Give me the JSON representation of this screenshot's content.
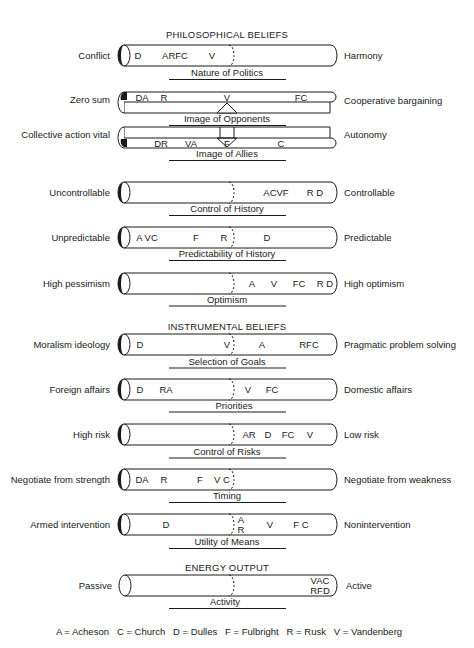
{
  "sections": {
    "philosophical": "PHILOSOPHICAL BELIEFS",
    "instrumental": "INSTRUMENTAL BELIEFS",
    "energy": "ENERGY OUTPUT"
  },
  "scales": [
    {
      "title": "Nature of Politics",
      "left": "Conflict",
      "right": "Harmony",
      "markers": [
        {
          "text": "D",
          "x": 138
        },
        {
          "text": "ARFC",
          "x": 175
        },
        {
          "text": "V",
          "x": 212
        }
      ]
    },
    {
      "title": "Image of Opponents",
      "left": "Zero sum",
      "right": "Cooperative bargaining",
      "markers": [
        {
          "text": "DA",
          "x": 142
        },
        {
          "text": "R",
          "x": 164
        },
        {
          "text": "V",
          "x": 227
        },
        {
          "text": "FC",
          "x": 301
        }
      ]
    },
    {
      "title": "Image of Allies",
      "left": "Collective action vital",
      "right": "Autonomy",
      "markers": [
        {
          "text": "DR",
          "x": 161
        },
        {
          "text": "VA",
          "x": 191
        },
        {
          "text": "F",
          "x": 227
        },
        {
          "text": "C",
          "x": 281
        }
      ]
    },
    {
      "title": "Control of History",
      "left": "Uncontrollable",
      "right": "Controllable",
      "markers": [
        {
          "text": "ACVF",
          "x": 276
        },
        {
          "text": "R D",
          "x": 315
        }
      ]
    },
    {
      "title": "Predictability of History",
      "left": "Unpredictable",
      "right": "Predictable",
      "markers": [
        {
          "text": "A VC",
          "x": 147
        },
        {
          "text": "F",
          "x": 196
        },
        {
          "text": "R",
          "x": 224
        },
        {
          "text": "D",
          "x": 267
        }
      ]
    },
    {
      "title": "Optimism",
      "left": "High pessimism",
      "right": "High optimism",
      "markers": [
        {
          "text": "A",
          "x": 252
        },
        {
          "text": "V",
          "x": 274
        },
        {
          "text": "FC",
          "x": 299
        },
        {
          "text": "R D",
          "x": 325
        }
      ]
    },
    {
      "title": "Selection of Goals",
      "left": "Moralism ideology",
      "right": "Pragmatic problem solving",
      "markers": [
        {
          "text": "D",
          "x": 140
        },
        {
          "text": "V",
          "x": 227
        },
        {
          "text": "A",
          "x": 262
        },
        {
          "text": "RFC",
          "x": 309
        }
      ]
    },
    {
      "title": "Priorities",
      "left": "Foreign affairs",
      "right": "Domestic affairs",
      "markers": [
        {
          "text": "D",
          "x": 140
        },
        {
          "text": "RA",
          "x": 166
        },
        {
          "text": "V",
          "x": 248
        },
        {
          "text": "FC",
          "x": 272
        }
      ]
    },
    {
      "title": "Control of Risks",
      "left": "High risk",
      "right": "Low risk",
      "markers": [
        {
          "text": "AR",
          "x": 257
        },
        {
          "text": "D",
          "x": 267
        },
        {
          "text": "FC",
          "x": 289
        },
        {
          "text": "V",
          "x": 310
        }
      ]
    },
    {
      "title": "Timing",
      "left": "Negotiate from strength",
      "right": "Negotiate from weakness",
      "markers": [
        {
          "text": "DA",
          "x": 142
        },
        {
          "text": "R",
          "x": 164
        },
        {
          "text": "F",
          "x": 200
        },
        {
          "text": "V C",
          "x": 226
        }
      ]
    },
    {
      "title": "Utility of Means",
      "left": "Armed intervention",
      "right": "Nonintervention",
      "markers": [
        {
          "text": "D",
          "x": 166
        },
        {
          "text": "A",
          "x": 241
        },
        {
          "text": "R",
          "x": 241
        },
        {
          "text": "V",
          "x": 270
        },
        {
          "text": "F C",
          "x": 301
        }
      ]
    },
    {
      "title": "Activity",
      "left": "Passive",
      "right": "Active",
      "markers": [
        {
          "text": "VAC",
          "x": 320
        },
        {
          "text": "RFD",
          "x": 320
        }
      ]
    }
  ],
  "legend": "A = Acheson   C = Church   D = Dulles   F = Fulbright   R = Rusk   V = Vandenberg"
}
